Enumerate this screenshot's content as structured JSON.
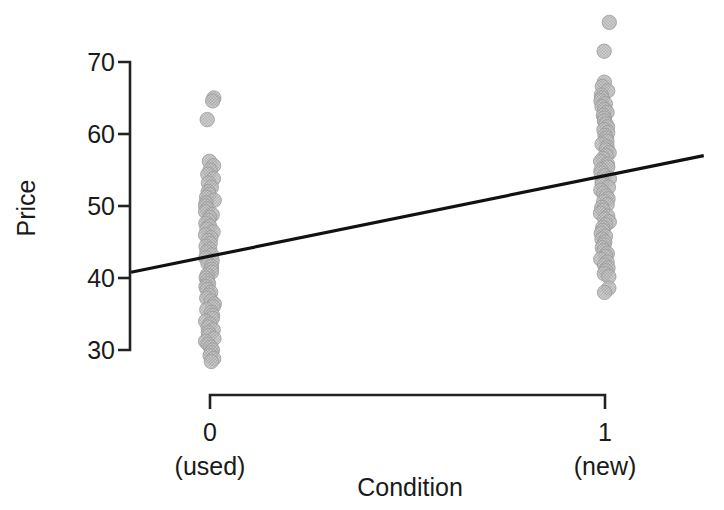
{
  "chart_data": {
    "type": "scatter",
    "title": "",
    "xlabel": "Condition",
    "ylabel": "Price",
    "grid": false,
    "legend": "none",
    "xlim": [
      -0.12,
      1.12
    ],
    "ylim": [
      26.0,
      77.0
    ],
    "x_categories": [
      "0",
      "1"
    ],
    "x_category_sublabels": [
      "(used)",
      "(new)"
    ],
    "xticks": [
      {
        "value": 0,
        "label": "0",
        "sublabel": "(used)"
      },
      {
        "value": 1,
        "label": "1",
        "sublabel": "(new)"
      }
    ],
    "yticks": [
      30,
      40,
      50,
      60,
      70
    ],
    "ytick_labels": [
      "30",
      "40",
      "50",
      "60",
      "70"
    ],
    "point_color": "#b0b0b0",
    "point_edge_color": "#9a9a9a",
    "line_color": "#111111",
    "axis_color": "#222222",
    "series": [
      {
        "name": "used",
        "x_value": 0,
        "values": [
          65.0,
          64.6,
          62.0,
          56.2,
          55.6,
          55.0,
          54.4,
          53.8,
          53.2,
          52.6,
          52.0,
          51.6,
          51.2,
          50.8,
          50.4,
          50.0,
          49.6,
          49.2,
          48.8,
          48.4,
          48.0,
          47.6,
          47.2,
          46.8,
          46.4,
          46.0,
          45.6,
          45.2,
          44.8,
          44.4,
          44.0,
          43.6,
          43.2,
          42.8,
          42.4,
          42.0,
          41.6,
          41.2,
          40.8,
          40.4,
          40.0,
          39.6,
          39.2,
          38.8,
          38.4,
          38.0,
          37.6,
          37.2,
          36.8,
          36.4,
          36.0,
          35.6,
          35.2,
          34.8,
          34.4,
          34.0,
          33.6,
          33.2,
          32.8,
          32.4,
          32.0,
          31.6,
          31.2,
          30.8,
          30.4,
          30.0,
          29.6,
          29.2,
          28.8,
          28.4
        ]
      },
      {
        "name": "new",
        "x_value": 1,
        "values": [
          75.5,
          71.5,
          67.2,
          66.6,
          66.0,
          65.4,
          65.0,
          64.6,
          64.2,
          63.8,
          63.4,
          63.0,
          62.6,
          62.2,
          61.8,
          61.4,
          61.0,
          60.6,
          60.2,
          59.8,
          59.4,
          59.0,
          58.6,
          58.2,
          57.8,
          57.4,
          57.0,
          56.6,
          56.2,
          55.8,
          55.4,
          55.0,
          54.6,
          54.2,
          53.8,
          53.4,
          53.0,
          52.6,
          52.2,
          51.8,
          51.4,
          51.0,
          50.6,
          50.2,
          49.8,
          49.4,
          49.0,
          48.6,
          48.2,
          47.8,
          47.4,
          47.0,
          46.6,
          46.2,
          45.8,
          45.4,
          45.0,
          44.6,
          44.2,
          43.8,
          43.4,
          43.0,
          42.6,
          42.2,
          41.8,
          41.4,
          41.0,
          40.6,
          40.2,
          38.6,
          38.0
        ]
      }
    ],
    "fit_line": {
      "label": "regression line",
      "x_start": -0.2,
      "x_end": 1.25,
      "y_start": 40.8,
      "y_end": 57.0,
      "intercept": 43.0,
      "slope": 11.2
    },
    "annotations": []
  },
  "axis": {
    "y_title": "Price",
    "x_title": "Condition"
  }
}
